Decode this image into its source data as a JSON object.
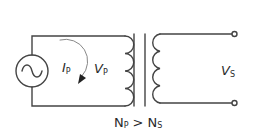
{
  "diagram": {
    "type": "step-down transformer circuit",
    "source": {
      "symbol": "ac-source",
      "glyph": "~"
    },
    "labels": {
      "current_primary": {
        "main": "I",
        "sub": "P"
      },
      "voltage_primary": {
        "main": "V",
        "sub": "P"
      },
      "voltage_secondary": {
        "main": "V",
        "sub": "S"
      },
      "turns_relation": {
        "left_main": "N",
        "left_sub": "P",
        "operator": ">",
        "right_main": "N",
        "right_sub": "S"
      }
    },
    "primary_coil_loops": 4,
    "secondary_coil_loops": 4,
    "core_bars": 2,
    "colors": {
      "stroke": "#444444",
      "text": "#2a2a2a",
      "background": "#ffffff"
    }
  }
}
